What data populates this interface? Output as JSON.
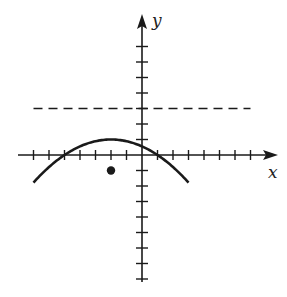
{
  "chart_data": {
    "type": "line",
    "title": "",
    "xlabel": "x",
    "ylabel": "y",
    "grid": false,
    "xlim": [
      -7,
      7
    ],
    "ylim": [
      -8,
      7
    ],
    "tick_spacing": 1,
    "series": [
      {
        "name": "parabola",
        "style": "solid",
        "equation": "y = -(1/9)(x+2)^2 + 1",
        "vertex": [
          -2,
          1
        ],
        "x_intercepts": [
          -5,
          1
        ],
        "x_range": [
          -7,
          3
        ],
        "points": [
          [
            -7,
            -1.78
          ],
          [
            -5,
            0
          ],
          [
            -2,
            1
          ],
          [
            1,
            0
          ],
          [
            3,
            -1.78
          ]
        ]
      },
      {
        "name": "horizontal-asymptote-line",
        "style": "dashed",
        "equation": "y = 3",
        "x_range": [
          -7,
          7
        ]
      },
      {
        "name": "point",
        "style": "marker",
        "points": [
          [
            -2,
            -1
          ]
        ]
      }
    ]
  },
  "labels": {
    "x_axis": "x",
    "y_axis": "y"
  },
  "colors": {
    "ink": "#1a1a1a",
    "background": "#ffffff"
  }
}
